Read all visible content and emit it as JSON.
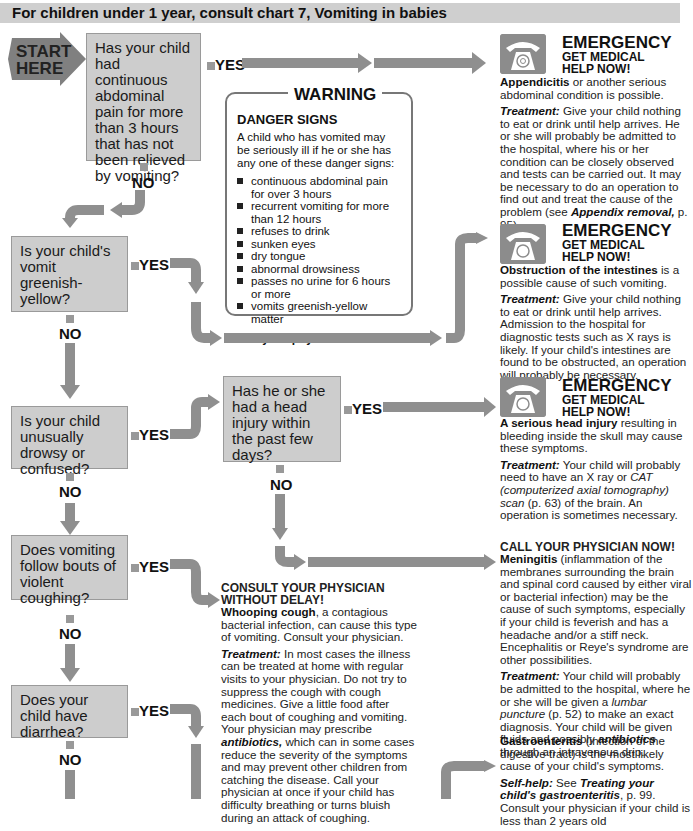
{
  "header": {
    "title": "For children under 1 year, consult chart 7, Vomiting in babies"
  },
  "start": {
    "line1": "START",
    "line2": "HERE"
  },
  "labels": {
    "yes": "YES",
    "no": "NO"
  },
  "questions": [
    {
      "id": "abdominal-pain",
      "text": "Has your child had continuous abdominal pain for more than 3 hours that has not been relieved by vomiting?"
    },
    {
      "id": "greenish-vomit",
      "text": "Is your child's vomit greenish-yellow?"
    },
    {
      "id": "drowsy",
      "text": "Is your child unusually drowsy or confused?"
    },
    {
      "id": "head-injury",
      "text": "Has he or she had a head injury within the past few days?"
    },
    {
      "id": "coughing",
      "text": "Does vomiting follow bouts of violent coughing?"
    },
    {
      "id": "diarrhea",
      "text": "Does your child have diarrhea?"
    }
  ],
  "warning": {
    "title": "WARNING",
    "heading": "DANGER SIGNS",
    "intro": "A child who has vomited may be seriously ill if he or she has any one of these danger signs:",
    "signs": [
      "continuous abdominal pain for over 3 hours",
      "recurrent vomiting for more than 12 hours",
      "refuses to drink",
      "sunken eyes",
      "dry tongue",
      "abnormal drowsiness",
      "passes no urine for 6 hours or more",
      "vomits greenish-yellow matter"
    ],
    "call": "Call your physician now!"
  },
  "emergency": {
    "title": "EMERGENCY",
    "sub1": "GET MEDICAL",
    "sub2": "HELP NOW!"
  },
  "outcomes": {
    "appendicitis": {
      "bold": "Appendicitis",
      "rest": " or another serious abdominal condition is possible.",
      "treat_label": "Treatment:",
      "treat": " Give your child nothing to eat or drink until help arrives. He or she will probably be admitted to the hospital, where his or her condition can be closely observed and tests can be carried out. It may be necessary to do an operation to find out and treat the cause of the problem (see ",
      "treat_ref": "Appendix removal,",
      "treat_end": " p. 95)."
    },
    "obstruction": {
      "bold": "Obstruction of the intestines",
      "rest": " is a possible cause of such vomiting.",
      "treat_label": "Treatment:",
      "treat": " Give your child nothing to eat or drink until help arrives. Admission to the hospital for diagnostic tests such as X rays is likely. If your child's intestines are found to be obstructed, an operation will probably be necessary."
    },
    "head_injury": {
      "bold": "A serious head injury",
      "rest": " resulting in bleeding inside the skull may cause these symptoms.",
      "treat_label": "Treatment:",
      "treat": " Your child will probably need to have an X ray or ",
      "treat_ref": "CAT (computerized axial tomography) scan",
      "treat_end": " (p. 63) of the brain. An operation is sometimes necessary."
    },
    "meningitis": {
      "caption": "CALL YOUR PHYSICIAN NOW!",
      "bold": "Meningitis",
      "rest": " (inflammation of the membranes surrounding the brain and spinal cord caused by either viral or bacterial infection) may be the cause of such symptoms, especially if your child is feverish and has a headache and/or a stiff neck. Encephalitis or Reye's syndrome are other possibilities.",
      "treat_label": "Treatment:",
      "treat": " Your child will probably be admitted to the hospital, where he or she will be given a ",
      "treat_ref": "lumbar puncture",
      "treat_mid": " (p. 52) to make an exact diagnosis. Your child will be given fluids and possibly ",
      "treat_ref2": "antibiotics",
      "treat_end": " through an intravenous drip."
    },
    "whooping": {
      "caption1": "CONSULT YOUR PHYSICIAN",
      "caption2": "WITHOUT DELAY!",
      "bold": "Whooping cough",
      "rest": ", a contagious bacterial infection, can cause this type of vomiting. Consult your physician.",
      "treat_label": "Treatment:",
      "treat": " In most cases the illness can be treated at home with regular visits to your physician. Do not try to suppress the cough with cough medicines. Give a little food after each bout of coughing and vomiting. Your physician may prescribe ",
      "treat_ref": "antibiotics,",
      "treat_end": " which can in some cases reduce the severity of the symptoms and may prevent other children from catching the disease. Call your physician at once if your child has difficulty breathing or turns bluish during an attack of coughing."
    },
    "gastro": {
      "bold": "Gastroenteritis",
      "rest": " (infection of the digestive tract) is the most likely cause of your child's symptoms.",
      "help_label": "Self-help:",
      "help": " See ",
      "help_ref": "Treating your child's gastroenteritis",
      "help_end": ", p. 99. Consult your physician if your child is less than 2 years old"
    }
  }
}
